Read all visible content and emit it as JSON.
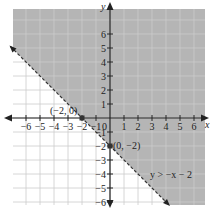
{
  "chart_data": {
    "type": "line",
    "title": "",
    "xlabel": "x",
    "ylabel": "y",
    "xlim": [
      -6.5,
      6.5
    ],
    "ylim": [
      -6.5,
      6.5
    ],
    "grid": true,
    "x_ticks": [
      -6,
      -5,
      -4,
      -3,
      -2,
      -1,
      1,
      2,
      3,
      4,
      5,
      6
    ],
    "y_ticks": [
      -6,
      -5,
      -4,
      -3,
      -2,
      -1,
      1,
      2,
      3,
      4,
      5,
      6
    ],
    "origin_label": "0",
    "boundary_line": {
      "equation": "y = -x - 2",
      "style": "dashed",
      "slope": -1,
      "intercept": -2
    },
    "shaded_region": "above boundary line",
    "inequality_label": "y > −x − 2",
    "points": [
      {
        "x": -2,
        "y": 0,
        "label": "(−2, 0)"
      },
      {
        "x": 0,
        "y": -2,
        "label": "(0, −2)"
      }
    ],
    "colors": {
      "shade": "#b5b5b5",
      "grid": "#cccccc",
      "axis": "#222222",
      "background": "#ffffff"
    }
  }
}
